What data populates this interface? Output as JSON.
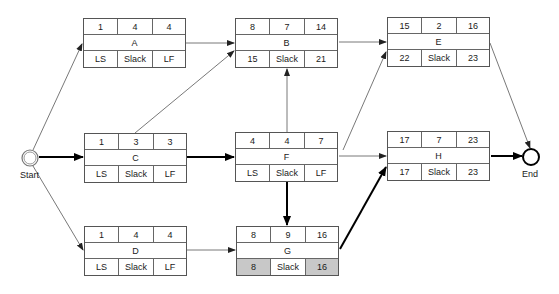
{
  "diagram": {
    "type": "activity-on-node network (critical path)",
    "start_label": "Start",
    "end_label": "End",
    "nodes": [
      {
        "id": "A",
        "es": "1",
        "dur": "4",
        "ef": "4",
        "ls": "LS",
        "slack": "Slack",
        "lf": "LF"
      },
      {
        "id": "B",
        "es": "8",
        "dur": "7",
        "ef": "14",
        "ls": "15",
        "slack": "Slack",
        "lf": "21"
      },
      {
        "id": "E",
        "es": "15",
        "dur": "2",
        "ef": "16",
        "ls": "22",
        "slack": "Slack",
        "lf": "23"
      },
      {
        "id": "C",
        "es": "1",
        "dur": "3",
        "ef": "3",
        "ls": "LS",
        "slack": "Slack",
        "lf": "LF"
      },
      {
        "id": "F",
        "es": "4",
        "dur": "4",
        "ef": "7",
        "ls": "LS",
        "slack": "Slack",
        "lf": "LF"
      },
      {
        "id": "H",
        "es": "17",
        "dur": "7",
        "ef": "23",
        "ls": "17",
        "slack": "Slack",
        "lf": "23"
      },
      {
        "id": "D",
        "es": "1",
        "dur": "4",
        "ef": "4",
        "ls": "LS",
        "slack": "Slack",
        "lf": "LF"
      },
      {
        "id": "G",
        "es": "8",
        "dur": "9",
        "ef": "16",
        "ls": "8",
        "slack": "Slack",
        "lf": "16"
      }
    ],
    "edges": [
      {
        "from": "Start",
        "to": "A",
        "critical": false
      },
      {
        "from": "Start",
        "to": "C",
        "critical": true
      },
      {
        "from": "Start",
        "to": "D",
        "critical": false
      },
      {
        "from": "A",
        "to": "B",
        "critical": false
      },
      {
        "from": "C",
        "to": "B",
        "critical": false
      },
      {
        "from": "C",
        "to": "F",
        "critical": true
      },
      {
        "from": "F",
        "to": "B",
        "critical": false
      },
      {
        "from": "F",
        "to": "E",
        "critical": false
      },
      {
        "from": "F",
        "to": "H",
        "critical": false
      },
      {
        "from": "F",
        "to": "G",
        "critical": true
      },
      {
        "from": "D",
        "to": "G",
        "critical": false
      },
      {
        "from": "B",
        "to": "E",
        "critical": false
      },
      {
        "from": "G",
        "to": "H",
        "critical": true
      },
      {
        "from": "E",
        "to": "End",
        "critical": false
      },
      {
        "from": "H",
        "to": "End",
        "critical": true
      }
    ],
    "colors": {
      "line": "#555555",
      "critical_line": "#000000",
      "shaded_cell": "#c8c8c8",
      "border": "#555555"
    }
  }
}
